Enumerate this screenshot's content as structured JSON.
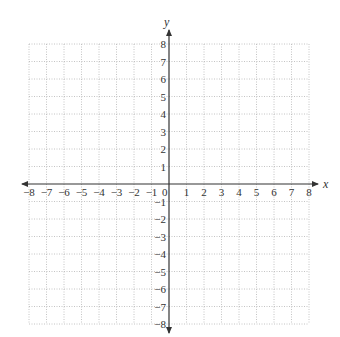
{
  "diagram": {
    "type": "coordinate-plane",
    "x_axis_label": "x",
    "y_axis_label": "y",
    "x_range": [
      -8,
      8
    ],
    "y_range": [
      -8,
      8
    ],
    "grid_step": 1,
    "grid_style": "dotted",
    "origin_label": "0",
    "x_ticks": [
      "-8",
      "-7",
      "-6",
      "-5",
      "-4",
      "-3",
      "-2",
      "-1",
      "1",
      "2",
      "3",
      "4",
      "5",
      "6",
      "7",
      "8"
    ],
    "y_ticks": [
      "8",
      "7",
      "6",
      "5",
      "4",
      "3",
      "2",
      "1",
      "-1",
      "-2",
      "-3",
      "-4",
      "-5",
      "-6",
      "-7",
      "-8"
    ],
    "colors": {
      "grid": "#b5b5b5",
      "axis": "#333333",
      "text": "#333333"
    }
  }
}
